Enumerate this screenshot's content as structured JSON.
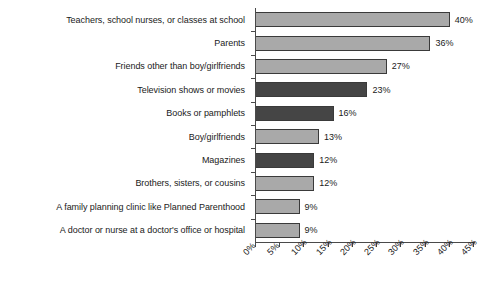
{
  "chart_data": {
    "type": "bar",
    "orientation": "horizontal",
    "title": "",
    "subtitle": "",
    "xlabel": "",
    "ylabel": "",
    "xlim": [
      0,
      45
    ],
    "grid": false,
    "legend": null,
    "xtick_labels": [
      "0%",
      "5%",
      "10%",
      "15%",
      "20%",
      "25%",
      "30%",
      "35%",
      "40%",
      "45%"
    ],
    "xtick_values": [
      0,
      5,
      10,
      15,
      20,
      25,
      30,
      35,
      40,
      45
    ],
    "xtick_rotation": -45,
    "value_label_suffix": "%",
    "colors": {
      "light_bar": "#a9a9a9",
      "dark_bar": "#454545",
      "bar_outline": "#3a3a3a",
      "axis": "#4a4a4a",
      "text": "#1a1a1a",
      "background": "#ffffff"
    },
    "categories": [
      "Teachers, school nurses, or classes at school",
      "Parents",
      "Friends other than boy/girlfriends",
      "Television shows or movies",
      "Books or pamphlets",
      "Boy/girlfriends",
      "Magazines",
      "Brothers, sisters, or cousins",
      "A family planning clinic like Planned Parenthood",
      "A doctor or nurse at a doctor's office or hospital"
    ],
    "values": [
      40,
      36,
      27,
      23,
      16,
      13,
      12,
      12,
      9,
      9
    ],
    "value_labels": [
      "40%",
      "36%",
      "27%",
      "23%",
      "16%",
      "13%",
      "12%",
      "12%",
      "9%",
      "9%"
    ],
    "bar_shades": [
      "light",
      "light",
      "light",
      "dark",
      "dark",
      "light",
      "dark",
      "light",
      "light",
      "light"
    ]
  }
}
